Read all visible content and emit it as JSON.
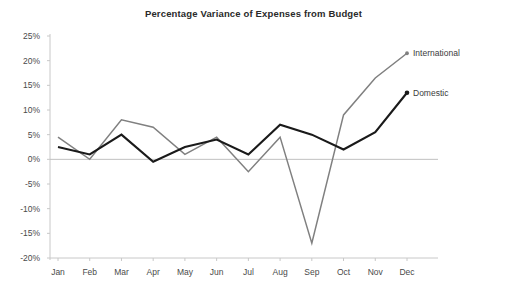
{
  "chart_data": {
    "type": "line",
    "title": "Percentage Variance of Expenses from Budget",
    "xlabel": "",
    "ylabel": "",
    "categories": [
      "Jan",
      "Feb",
      "Mar",
      "Apr",
      "May",
      "Jun",
      "Jul",
      "Aug",
      "Sep",
      "Oct",
      "Nov",
      "Dec"
    ],
    "ylim": [
      -20,
      25
    ],
    "ytick_labels": [
      "25%",
      "20%",
      "15%",
      "10%",
      "5%",
      "0%",
      "-5%",
      "-10%",
      "-15%",
      "-20%"
    ],
    "ytick_values": [
      25,
      20,
      15,
      10,
      5,
      0,
      -5,
      -10,
      -15,
      -20
    ],
    "grid": false,
    "zero_line": true,
    "legend_position": "right-inline-labels",
    "series": [
      {
        "name": "International",
        "color": "#808080",
        "values": [
          4.5,
          0,
          8,
          6.5,
          1,
          4.5,
          -2.5,
          4.5,
          -17,
          9,
          16.5,
          21.5
        ]
      },
      {
        "name": "Domestic",
        "color": "#1a1a1a",
        "values": [
          2.5,
          1,
          5,
          -0.5,
          2.5,
          4,
          1,
          7,
          5,
          2,
          5.5,
          13.5
        ]
      }
    ]
  },
  "axis_colors": {
    "axis_line": "#c8c8c8",
    "zero_line": "#c0c0c0",
    "text": "#4a4a4a"
  }
}
